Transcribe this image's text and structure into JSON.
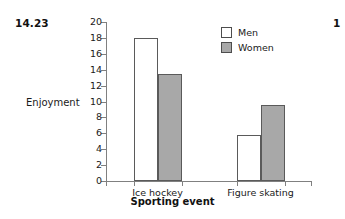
{
  "figure_label": "14.23",
  "edge_partial_label": "1",
  "colors": {
    "men_fill": "#ffffff",
    "women_fill": "#a8a8a8",
    "bar_stroke": "#5a5a5a",
    "axis": "#808080",
    "text": "#1a1a1a",
    "background": "#ffffff"
  },
  "chart_data": {
    "type": "bar",
    "title": "",
    "xlabel": "Sporting event",
    "ylabel": "Enjoyment",
    "categories": [
      "Ice hockey",
      "Figure skating"
    ],
    "series": [
      {
        "name": "Men",
        "values": [
          18.0,
          5.8
        ]
      },
      {
        "name": "Women",
        "values": [
          13.5,
          9.5
        ]
      }
    ],
    "ylim": [
      0,
      20
    ],
    "ytick_labels": [
      "20",
      "18",
      "16",
      "14",
      "12",
      "10",
      "8",
      "6",
      "4",
      "2",
      "0"
    ],
    "ytick_values": [
      20,
      18,
      16,
      14,
      12,
      10,
      8,
      6,
      4,
      2,
      0
    ],
    "grid": false,
    "legend_position": "top-right",
    "legend_entries": [
      "Men",
      "Women"
    ]
  }
}
